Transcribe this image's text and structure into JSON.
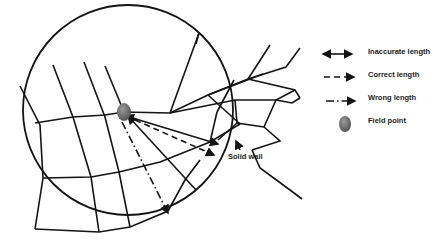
{
  "labels": {
    "solid_wall": "Solid wall"
  },
  "legend": {
    "items": [
      {
        "label": "Inaccurate length",
        "symbol": "double-arrow-solid"
      },
      {
        "label": "Correct length",
        "symbol": "dashed-arrow"
      },
      {
        "label": "Wrong length",
        "symbol": "dash-dot-arrow"
      },
      {
        "label": "Field point",
        "symbol": "gray-ellipse"
      }
    ]
  },
  "colors": {
    "line": "#141414",
    "field_point": "#6e6e6e"
  }
}
